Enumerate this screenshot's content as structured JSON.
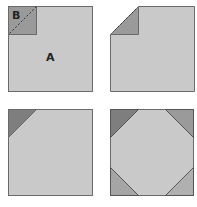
{
  "colors": {
    "square_fill": "#c9c9c9",
    "square_stroke": "#6a6a6a",
    "corner_dark": "#8a8a8a",
    "corner_mid": "#a5a5a5",
    "dashed_line": "#333333"
  },
  "panels": [
    {
      "id": "step-1",
      "labels": {
        "small_square": "B",
        "large_square": "A"
      }
    },
    {
      "id": "step-2"
    },
    {
      "id": "step-3"
    },
    {
      "id": "step-4"
    }
  ]
}
